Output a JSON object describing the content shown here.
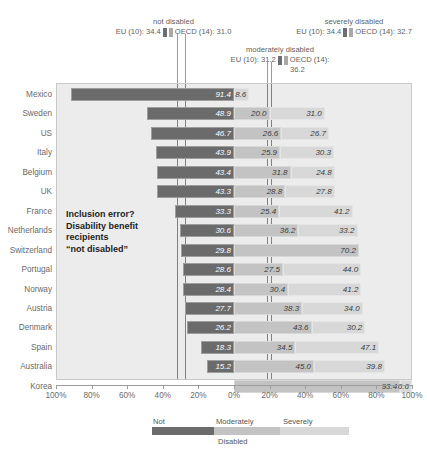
{
  "top_clipped_text": " ",
  "note": {
    "line1": "Inclusion error?",
    "line2": "Disability benefit",
    "line3": "recipients",
    "line4": "“not disabled”"
  },
  "annotations": [
    {
      "id": "not-disabled",
      "title": "not disabled",
      "eu_label": "EU (10): 34.4",
      "oecd_label": "OECD (14): 31.0",
      "eu_value": 34.4,
      "oecd_value": 31.0
    },
    {
      "id": "moderately-disabled",
      "title": "moderately disabled",
      "eu_label": "EU (10): 31.2",
      "oecd_label": "OECD (14):",
      "oecd_label2": "36.2",
      "eu_value": 31.2,
      "oecd_value": 36.2
    },
    {
      "id": "severely-disabled",
      "title": "severely disabled",
      "eu_label": "EU (10): 34.4",
      "oecd_label": "OECD (14): 32.7",
      "eu_value": 34.4,
      "oecd_value": 32.7
    }
  ],
  "legend": {
    "not": "Not",
    "moderately": "Moderately",
    "severely": "Severely",
    "caption": "Disabled"
  },
  "axis": {
    "ticks": [
      "100%",
      "80%",
      "60%",
      "40%",
      "20%",
      "0%",
      "20%",
      "40%",
      "60%",
      "80%",
      "100%"
    ]
  },
  "colors": {
    "not": "#6b6b6b",
    "moderately": "#c3c3c3",
    "severely": "#d8d8d8",
    "panel": "#ececec",
    "guide": "#808080"
  },
  "chart_data": {
    "type": "bar",
    "title": "",
    "xlabel": "",
    "ylabel": "",
    "orientation": "horizontal",
    "stacked": true,
    "diverging": true,
    "zero_at_category": "boundary between Not and Moderately",
    "xlim": [
      -100,
      100
    ],
    "xticks": [
      -100,
      -80,
      -60,
      -40,
      -20,
      0,
      20,
      40,
      60,
      80,
      100
    ],
    "xticklabels": [
      "100%",
      "80%",
      "60%",
      "40%",
      "20%",
      "0%",
      "20%",
      "40%",
      "60%",
      "80%",
      "100%"
    ],
    "grid": false,
    "legend_position": "bottom",
    "series": [
      {
        "name": "Not",
        "values": [
          91.4,
          48.9,
          46.7,
          43.9,
          43.4,
          43.3,
          33.3,
          30.6,
          29.8,
          28.6,
          28.4,
          27.7,
          26.2,
          18.3,
          15.2,
          0.0
        ]
      },
      {
        "name": "Moderately",
        "values": [
          0.0,
          20.0,
          26.6,
          25.9,
          31.8,
          28.8,
          25.4,
          36.2,
          70.2,
          27.5,
          30.4,
          38.3,
          43.6,
          34.5,
          45.0,
          93.4
        ]
      },
      {
        "name": "Severely",
        "values": [
          8.6,
          31.0,
          26.7,
          30.3,
          24.8,
          27.8,
          41.2,
          33.2,
          0.0,
          44.0,
          41.2,
          34.0,
          30.2,
          47.1,
          39.8,
          6.6
        ]
      }
    ],
    "categories": [
      "Mexico",
      "Sweden",
      "US",
      "Italy",
      "Belgium",
      "UK",
      "France",
      "Netherlands",
      "Switzerland",
      "Portugal",
      "Norway",
      "Austria",
      "Denmark",
      "Spain",
      "Australia",
      "Korea"
    ],
    "reference_lines": [
      {
        "label": "not disabled EU (10)",
        "value": 34.4
      },
      {
        "label": "not disabled OECD (14)",
        "value": 31.0
      },
      {
        "label": "moderately disabled EU (10)",
        "value": 31.2
      },
      {
        "label": "moderately disabled OECD (14)",
        "value": 36.2
      },
      {
        "label": "severely disabled EU (10)",
        "value": 34.4
      },
      {
        "label": "severely disabled OECD (14)",
        "value": 32.7
      }
    ]
  }
}
